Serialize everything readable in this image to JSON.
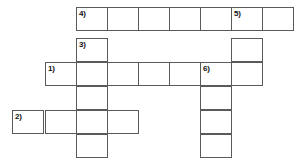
{
  "puzzle": {
    "title": "Crossword puzzle grid",
    "cell_width": 31.6,
    "cell_height": 24,
    "grid_line_color": "#5a5a5a",
    "cell_fill_color": "#ffffff",
    "background_color": "#ffffff",
    "number_color": "#111111",
    "clue_numbers": [
      "1)",
      "2)",
      "3)",
      "4)",
      "5)",
      "6)"
    ],
    "entries": [
      {
        "number": "4)",
        "direction": "across",
        "length": 7,
        "start_col": 2,
        "start_row": 0,
        "numbered_cells": [
          {
            "index": 0,
            "label": "4)"
          },
          {
            "index": 5,
            "label": "5)"
          }
        ]
      },
      {
        "number": "3)",
        "direction": "down",
        "length": 5,
        "start_col": 2,
        "start_row": 1,
        "numbered_cells": [
          {
            "index": 0,
            "label": "3)"
          }
        ]
      },
      {
        "number": "1)",
        "direction": "across",
        "length": 7,
        "start_col": 1,
        "start_row": 2,
        "numbered_cells": [
          {
            "index": 0,
            "label": "1)"
          },
          {
            "index": 5,
            "label": "6)"
          }
        ]
      },
      {
        "number": "5)",
        "direction": "down",
        "length": 3,
        "start_col": 7,
        "start_row": 0,
        "numbered_cells": [
          {
            "index": 0,
            "label": "5)"
          }
        ]
      },
      {
        "number": "6)",
        "direction": "down",
        "length": 6,
        "start_col": 6,
        "start_row": 2,
        "numbered_cells": [
          {
            "index": 0,
            "label": "6)"
          }
        ]
      },
      {
        "number": "2)",
        "direction": "across",
        "length": 4,
        "start_col": 0,
        "start_row": 4,
        "numbered_cells": [
          {
            "index": 0,
            "label": "2)"
          }
        ]
      }
    ],
    "cells": [
      {
        "id": "c-r0-c2",
        "x": 76,
        "y": 7,
        "w": 32,
        "h": 24,
        "number": "4)"
      },
      {
        "id": "c-r0-c3",
        "x": 107,
        "y": 7,
        "w": 32,
        "h": 24,
        "number": ""
      },
      {
        "id": "c-r0-c4",
        "x": 138,
        "y": 7,
        "w": 32,
        "h": 24,
        "number": ""
      },
      {
        "id": "c-r0-c5",
        "x": 169,
        "y": 7,
        "w": 32,
        "h": 24,
        "number": ""
      },
      {
        "id": "c-r0-c6",
        "x": 200,
        "y": 7,
        "w": 32,
        "h": 24,
        "number": ""
      },
      {
        "id": "c-r0-c7",
        "x": 231,
        "y": 7,
        "w": 32,
        "h": 24,
        "number": "5)"
      },
      {
        "id": "c-r0-c8",
        "x": 262,
        "y": 7,
        "w": 32,
        "h": 24,
        "number": ""
      },
      {
        "id": "c-r1-c2",
        "x": 76,
        "y": 38,
        "w": 32,
        "h": 24,
        "number": "3)"
      },
      {
        "id": "c-r1-c7",
        "x": 231,
        "y": 38,
        "w": 32,
        "h": 24,
        "number": ""
      },
      {
        "id": "c-r2-c1",
        "x": 45,
        "y": 62,
        "w": 32,
        "h": 24,
        "number": "1)"
      },
      {
        "id": "c-r2-c2",
        "x": 76,
        "y": 62,
        "w": 32,
        "h": 24,
        "number": ""
      },
      {
        "id": "c-r2-c3",
        "x": 107,
        "y": 62,
        "w": 32,
        "h": 24,
        "number": ""
      },
      {
        "id": "c-r2-c4",
        "x": 138,
        "y": 62,
        "w": 32,
        "h": 24,
        "number": ""
      },
      {
        "id": "c-r2-c5",
        "x": 169,
        "y": 62,
        "w": 32,
        "h": 24,
        "number": ""
      },
      {
        "id": "c-r2-c6",
        "x": 200,
        "y": 62,
        "w": 32,
        "h": 24,
        "number": "6)"
      },
      {
        "id": "c-r2-c7",
        "x": 231,
        "y": 62,
        "w": 32,
        "h": 24,
        "number": ""
      },
      {
        "id": "c-r3-c2",
        "x": 76,
        "y": 86,
        "w": 32,
        "h": 24,
        "number": ""
      },
      {
        "id": "c-r3-c6",
        "x": 200,
        "y": 86,
        "w": 32,
        "h": 24,
        "number": ""
      },
      {
        "id": "c-r4-c0",
        "x": 12,
        "y": 110,
        "w": 32,
        "h": 24,
        "number": "2)"
      },
      {
        "id": "c-r4-c1",
        "x": 45,
        "y": 110,
        "w": 32,
        "h": 24,
        "number": ""
      },
      {
        "id": "c-r4-c2",
        "x": 76,
        "y": 110,
        "w": 32,
        "h": 24,
        "number": ""
      },
      {
        "id": "c-r4-c3",
        "x": 107,
        "y": 110,
        "w": 32,
        "h": 24,
        "number": ""
      },
      {
        "id": "c-r4-c6",
        "x": 200,
        "y": 110,
        "w": 32,
        "h": 24,
        "number": ""
      },
      {
        "id": "c-r5-c2",
        "x": 76,
        "y": 134,
        "w": 32,
        "h": 24,
        "number": ""
      },
      {
        "id": "c-r5-c6",
        "x": 200,
        "y": 134,
        "w": 32,
        "h": 24,
        "number": ""
      }
    ]
  }
}
